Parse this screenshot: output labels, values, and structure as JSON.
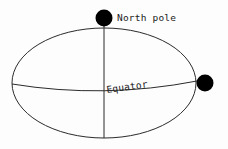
{
  "diagram": {
    "background_color": "#fdfdfd",
    "stroke_color": "#2b2b2b",
    "marker_color": "#000000",
    "labels": {
      "north_pole": "North pole",
      "equator": "Equator"
    },
    "geometry": {
      "ellipse": {
        "cx": 104,
        "cy": 83,
        "rx": 92,
        "ry": 55,
        "stroke_width": 1
      },
      "axis_line": {
        "x": 104,
        "y_top": 18,
        "y_bottom": 138,
        "stroke_width": 1
      },
      "equator_curve": {
        "x_start": 12,
        "y_start": 84,
        "x_end": 197,
        "y_end": 81,
        "sag_y": 99,
        "stroke_width": 1
      },
      "north_pole_marker": {
        "cx": 104,
        "cy": 18,
        "r": 8.5
      },
      "right_marker": {
        "cx": 205,
        "cy": 83,
        "r": 8.5
      }
    },
    "label_positions": {
      "north_pole": {
        "x": 117,
        "y": 21,
        "rotation": 0
      },
      "equator": {
        "x": 107,
        "y": 93,
        "rotation": -8
      }
    }
  }
}
